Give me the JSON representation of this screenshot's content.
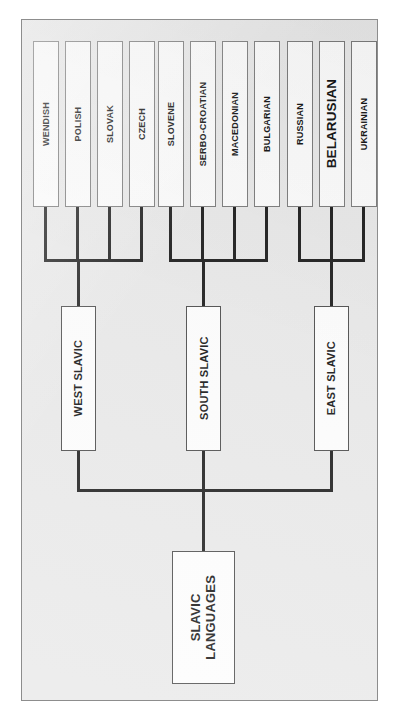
{
  "diagram": {
    "title": "Slavic Languages",
    "orientation": "rotated-90-ccw",
    "background_color": "#e9e9e9",
    "box_fill_color": "#fdfdfd",
    "line_color": "#1a1a1a",
    "text_color": "#111111",
    "root": {
      "line1": "SLAVIC",
      "line2": "LANGUAGES"
    },
    "branches": [
      {
        "label": "WEST SLAVIC",
        "leaves": [
          {
            "label": "WENDISH",
            "emphasis": false
          },
          {
            "label": "POLISH",
            "emphasis": false
          },
          {
            "label": "SLOVAK",
            "emphasis": false
          },
          {
            "label": "CZECH",
            "emphasis": false
          }
        ]
      },
      {
        "label": "SOUTH SLAVIC",
        "leaves": [
          {
            "label": "SLOVENE",
            "emphasis": false
          },
          {
            "label": "SERBO-CROATIAN",
            "emphasis": false
          },
          {
            "label": "MACEDONIAN",
            "emphasis": false
          },
          {
            "label": "BULGARIAN",
            "emphasis": false
          }
        ]
      },
      {
        "label": "EAST SLAVIC",
        "leaves": [
          {
            "label": "RUSSIAN",
            "emphasis": false
          },
          {
            "label": "BELARUSIAN",
            "emphasis": true
          },
          {
            "label": "UKRAINIAN",
            "emphasis": false
          }
        ]
      }
    ]
  }
}
